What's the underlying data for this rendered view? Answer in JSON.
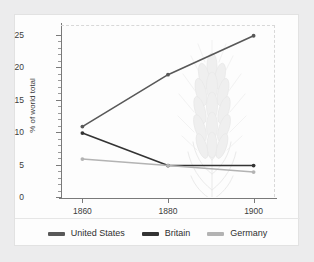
{
  "chart_data": {
    "type": "line",
    "title": "",
    "xlabel": "",
    "ylabel": "% of world total",
    "x": [
      1860,
      1880,
      1900
    ],
    "xtick_labels": [
      "1860",
      "1880",
      "1900"
    ],
    "ytick_labels": [
      "0",
      "5",
      "10",
      "15",
      "20",
      "25"
    ],
    "ytick_values": [
      0,
      5,
      10,
      15,
      20,
      25
    ],
    "yminor_step": 1,
    "xlim": [
      1855,
      1905
    ],
    "ylim": [
      0,
      26.5
    ],
    "grid": false,
    "legend_position": "bottom",
    "background_watermark": "wheat-sheaf",
    "series": [
      {
        "name": "United States",
        "values": [
          11,
          19,
          25
        ],
        "color": "#585858"
      },
      {
        "name": "Britain",
        "values": [
          10,
          5,
          5
        ],
        "color": "#333333"
      },
      {
        "name": "Germany",
        "values": [
          6,
          5,
          4
        ],
        "color": "#b3b3b3"
      }
    ]
  },
  "legend": {
    "items": [
      {
        "label": "United States",
        "color": "#585858"
      },
      {
        "label": "Britain",
        "color": "#333333"
      },
      {
        "label": "Germany",
        "color": "#b3b3b3"
      }
    ]
  }
}
